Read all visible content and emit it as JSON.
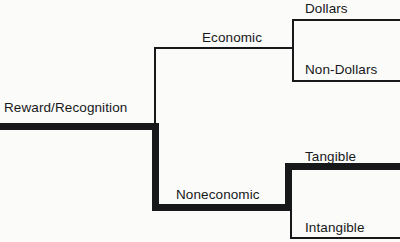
{
  "diagram": {
    "type": "tree-diagram",
    "background_color": "#fbfbf9",
    "line_color": "#16181a",
    "text_color": "#16181a",
    "thin_stroke_px": 2,
    "thick_stroke_px": 7,
    "nodes": {
      "root": {
        "label": "Reward/Recognition",
        "level": 0,
        "emphasis": "bold"
      },
      "economic": {
        "label": "Economic",
        "level": 1,
        "emphasis": "normal"
      },
      "noneconomic": {
        "label": "Noneconomic",
        "level": 1,
        "emphasis": "bold"
      },
      "dollars": {
        "label": "Dollars",
        "level": 2,
        "emphasis": "normal"
      },
      "non_dollars": {
        "label": "Non-Dollars",
        "level": 2,
        "emphasis": "normal"
      },
      "tangible": {
        "label": "Tangible",
        "level": 2,
        "emphasis": "bold"
      },
      "intangible": {
        "label": "Intangible",
        "level": 2,
        "emphasis": "normal"
      }
    },
    "edges": [
      {
        "from": "root",
        "to": "economic",
        "emphasis": "normal"
      },
      {
        "from": "root",
        "to": "noneconomic",
        "emphasis": "bold"
      },
      {
        "from": "economic",
        "to": "dollars",
        "emphasis": "normal"
      },
      {
        "from": "economic",
        "to": "non_dollars",
        "emphasis": "normal"
      },
      {
        "from": "noneconomic",
        "to": "tangible",
        "emphasis": "bold"
      },
      {
        "from": "noneconomic",
        "to": "intangible",
        "emphasis": "normal"
      }
    ],
    "highlighted_path": [
      "root",
      "noneconomic",
      "tangible"
    ]
  }
}
